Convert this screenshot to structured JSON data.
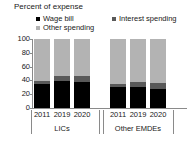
{
  "chart_data": {
    "type": "bar",
    "title": "Percent of expense",
    "subtitle": "",
    "xlabel": "",
    "ylabel": "",
    "ylim": [
      0,
      100
    ],
    "yticks": [
      100,
      80,
      60,
      40,
      20,
      0
    ],
    "grid": false,
    "stacked": true,
    "legend_position": "top",
    "categories": [
      "2011",
      "2019",
      "2020",
      "2011",
      "2019",
      "2020"
    ],
    "groups": [
      {
        "label": "LICs",
        "categories": [
          "2011",
          "2019",
          "2020"
        ]
      },
      {
        "label": "Other EMDEs",
        "categories": [
          "2011",
          "2019",
          "2020"
        ]
      }
    ],
    "series": [
      {
        "name": "Wage bill",
        "color": "#000000",
        "values": [
          35,
          39,
          37,
          30,
          30,
          28
        ]
      },
      {
        "name": "Interest spending",
        "color": "#595959",
        "values": [
          4,
          8,
          9,
          5,
          7,
          8
        ]
      },
      {
        "name": "Other spending",
        "color": "#b3b3b3",
        "values": [
          61,
          53,
          54,
          65,
          63,
          64
        ]
      }
    ]
  },
  "legend": {
    "items": [
      {
        "label": "Wage bill",
        "color": "#000000"
      },
      {
        "label": "Interest spending",
        "color": "#595959"
      },
      {
        "label": "Other spending",
        "color": "#b3b3b3"
      }
    ]
  },
  "axis": {
    "y_ticks": [
      "100",
      "80",
      "60",
      "40",
      "20",
      "0"
    ]
  },
  "colors": {
    "wage": "#000000",
    "interest": "#595959",
    "other": "#b3b3b3",
    "axis": "#8a8a8a",
    "text": "#202020",
    "background": "#ffffff"
  }
}
